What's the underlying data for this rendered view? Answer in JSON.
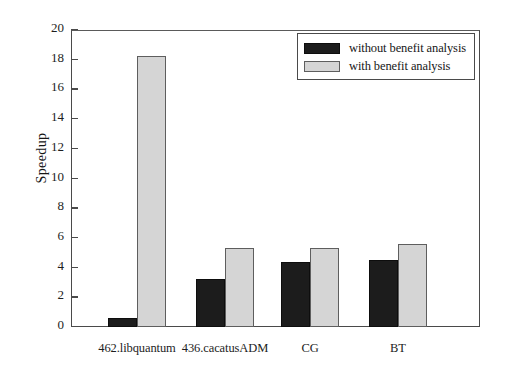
{
  "chart_data": {
    "type": "bar",
    "title": "",
    "xlabel": "",
    "ylabel": "Speedup",
    "ylim": [
      0,
      20
    ],
    "yticks": [
      0,
      2,
      4,
      6,
      8,
      10,
      12,
      14,
      16,
      18,
      20
    ],
    "ytick_labels": [
      "0",
      "2",
      "4",
      "6",
      "8",
      "10",
      "12",
      "14",
      "16",
      "18",
      "20"
    ],
    "grid": false,
    "legend_position": "top-right",
    "categories": [
      "462.libquantum",
      "436.cacatusADM",
      "CG",
      "BT"
    ],
    "series": [
      {
        "name": "without benefit analysis",
        "color": "#1c1c1c",
        "values": [
          0.6,
          3.2,
          4.4,
          4.5
        ]
      },
      {
        "name": "with benefit analysis",
        "color": "#d5d5d5",
        "values": [
          18.25,
          5.3,
          5.3,
          5.6
        ]
      }
    ]
  },
  "legend": {
    "entries": [
      {
        "label": "without benefit analysis"
      },
      {
        "label": "with benefit analysis"
      }
    ]
  },
  "axes": {
    "y_title": "Speedup"
  }
}
